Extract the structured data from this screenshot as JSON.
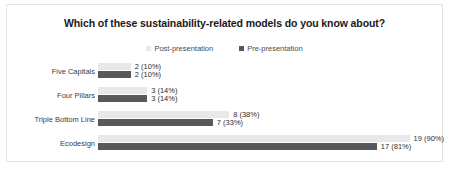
{
  "chart_data": {
    "type": "bar",
    "orientation": "horizontal",
    "title": "Which of these sustainability-related models do you know about?",
    "xlabel": "",
    "ylabel": "",
    "categories": [
      "Five Capitals",
      "Four Pillars",
      "Triple Bottom Line",
      "Ecodesign"
    ],
    "xlim": [
      0,
      21
    ],
    "grid": false,
    "legend_position": "top-center",
    "series": [
      {
        "name": "Post-presentation",
        "color": "#e8e8e8",
        "values": [
          2,
          3,
          8,
          19
        ],
        "labels": [
          "2 (10%)",
          "3 (14%)",
          "8 (38%)",
          "19 (90%)"
        ]
      },
      {
        "name": "Pre-presentation",
        "color": "#595959",
        "values": [
          2,
          3,
          7,
          17
        ],
        "labels": [
          "2 (10%)",
          "3 (14%)",
          "7 (33%)",
          "17 (81%)"
        ]
      }
    ]
  },
  "legend": [
    {
      "label": "Post-presentation",
      "color": "#e8e8e8"
    },
    {
      "label": "Pre-presentation",
      "color": "#595959"
    }
  ],
  "rows": [
    {
      "category": "Five Capitals",
      "top": {
        "value": 2,
        "label": "2 (10%)"
      },
      "bottom": {
        "value": 2,
        "label": "2 (10%)"
      }
    },
    {
      "category": "Four Pillars",
      "top": {
        "value": 3,
        "label": "3 (14%)"
      },
      "bottom": {
        "value": 3,
        "label": "3 (14%)"
      }
    },
    {
      "category": "Triple Bottom Line",
      "top": {
        "value": 8,
        "label": "8 (38%)"
      },
      "bottom": {
        "value": 7,
        "label": "7 (33%)"
      }
    },
    {
      "category": "Ecodesign",
      "top": {
        "value": 19,
        "label": "19 (90%)"
      },
      "bottom": {
        "value": 17,
        "label": "17 (81%)"
      }
    }
  ]
}
